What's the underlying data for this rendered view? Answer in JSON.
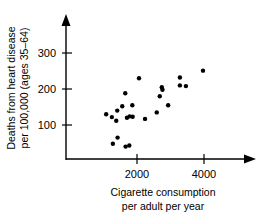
{
  "chart_data": {
    "type": "scatter",
    "title": "",
    "xlabel": "Cigarette consumption per adult per year",
    "xlabel_line1": "Cigarette consumption",
    "xlabel_line2": "per adult per year",
    "ylabel": "Deaths from heart disease per 100,000 (ages 35–64)",
    "ylabel_line1": "Deaths from heart disease",
    "ylabel_line2": "per 100,000 (ages 35–64)",
    "xticks": [
      2000,
      4000
    ],
    "xtick_labels": [
      "2000",
      "4000"
    ],
    "yticks": [
      100,
      200,
      300
    ],
    "ytick_labels": [
      "100",
      "200",
      "300"
    ],
    "xlim": [
      0,
      4600
    ],
    "ylim": [
      0,
      330
    ],
    "grid": false,
    "legend": null,
    "marker": "filled-circle",
    "marker_color": "#000000",
    "points": [
      {
        "x": 1080,
        "y": 130
      },
      {
        "x": 1250,
        "y": 122
      },
      {
        "x": 1380,
        "y": 112
      },
      {
        "x": 1410,
        "y": 140
      },
      {
        "x": 1650,
        "y": 188
      },
      {
        "x": 1700,
        "y": 120
      },
      {
        "x": 1780,
        "y": 124
      },
      {
        "x": 1870,
        "y": 123
      },
      {
        "x": 1860,
        "y": 155
      },
      {
        "x": 2060,
        "y": 230
      },
      {
        "x": 2240,
        "y": 117
      },
      {
        "x": 2590,
        "y": 135
      },
      {
        "x": 2740,
        "y": 205
      },
      {
        "x": 2760,
        "y": 198
      },
      {
        "x": 2930,
        "y": 155
      },
      {
        "x": 3280,
        "y": 210
      },
      {
        "x": 3280,
        "y": 232
      },
      {
        "x": 3460,
        "y": 208
      },
      {
        "x": 3970,
        "y": 251
      },
      {
        "x": 1280,
        "y": 48
      },
      {
        "x": 1420,
        "y": 65
      },
      {
        "x": 1660,
        "y": 40
      },
      {
        "x": 1770,
        "y": 43
      },
      {
        "x": 1560,
        "y": 152
      },
      {
        "x": 2680,
        "y": 180
      }
    ]
  },
  "axis": {
    "x_axis_name": "x-axis",
    "y_axis_name": "y-axis",
    "arrow_x": "x-axis-arrow",
    "arrow_y": "y-axis-arrow"
  }
}
